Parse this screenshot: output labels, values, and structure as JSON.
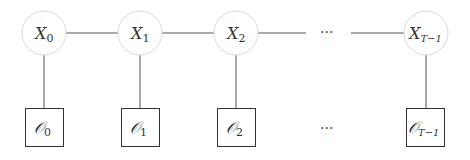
{
  "diagram": {
    "type": "hidden-markov-chain",
    "hidden_nodes": [
      {
        "id": "x0",
        "base": "X",
        "sub": "0",
        "cx": 44
      },
      {
        "id": "x1",
        "base": "X",
        "sub": "1",
        "cx": 140
      },
      {
        "id": "x2",
        "base": "X",
        "sub": "2",
        "cx": 236
      },
      {
        "id": "xT",
        "base": "X",
        "sub": "T−1",
        "cx": 426
      }
    ],
    "observed_nodes": [
      {
        "id": "o0",
        "base": "𝒪",
        "sub": "0",
        "cx": 44
      },
      {
        "id": "o1",
        "base": "𝒪",
        "sub": "1",
        "cx": 140
      },
      {
        "id": "o2",
        "base": "𝒪",
        "sub": "2",
        "cx": 236
      },
      {
        "id": "oT",
        "base": "𝒪",
        "sub": "T−1",
        "cx": 426
      }
    ],
    "ellipsis_top": "···",
    "ellipsis_bottom": "···",
    "colors": {
      "circle_stroke": "#d8d8d8",
      "edge": "#555555",
      "box_stroke": "#333333"
    }
  }
}
